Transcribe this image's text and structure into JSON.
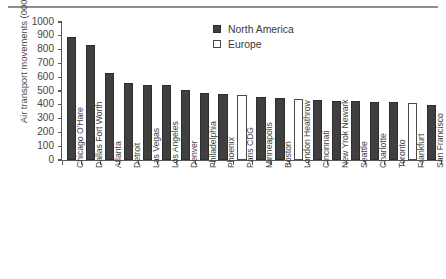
{
  "chart_data": {
    "type": "bar",
    "title": "",
    "subtitle": "",
    "xlabel": "",
    "ylabel": "Air transport movements (000s)",
    "ylim": [
      0,
      1000
    ],
    "ytick_labels": [
      "1000",
      "900",
      "800",
      "700",
      "600",
      "500",
      "400",
      "300",
      "200",
      "100",
      "0"
    ],
    "ytick_values": [
      1000,
      900,
      800,
      700,
      600,
      500,
      400,
      300,
      200,
      100,
      0
    ],
    "grid": false,
    "legend_position": "top-center-right",
    "legend": [
      {
        "label": "North America",
        "swatch": "filled-dark-square",
        "color": "#3f3f3f"
      },
      {
        "label": "Europe",
        "swatch": "open-white-square",
        "color": "#ffffff"
      }
    ],
    "categories": [
      "Chicago O'Hare",
      "Dallas Fort Worth",
      "Atlanta",
      "Detroit",
      "Las Vegas",
      "Los Angeles",
      "Denver",
      "Philadelphia",
      "Phoenix",
      "Paris CDG",
      "Minneapolis",
      "Boston",
      "London Heathrow",
      "Cincinnati",
      "New Yrok Newark",
      "Seattle",
      "Charlotte",
      "Toronto",
      "Frankfurt",
      "San Francisco"
    ],
    "values": [
      895,
      835,
      630,
      557,
      543,
      543,
      505,
      483,
      478,
      468,
      455,
      450,
      443,
      435,
      430,
      428,
      423,
      420,
      410,
      400
    ],
    "series": [
      {
        "name": "North America",
        "values": [
          895,
          835,
          630,
          557,
          543,
          543,
          505,
          483,
          478,
          null,
          455,
          450,
          null,
          435,
          430,
          428,
          423,
          420,
          null,
          400
        ]
      },
      {
        "name": "Europe",
        "values": [
          null,
          null,
          null,
          null,
          null,
          null,
          null,
          null,
          null,
          468,
          null,
          null,
          443,
          null,
          null,
          null,
          null,
          null,
          410,
          null
        ]
      }
    ],
    "group_of_bar": [
      "na",
      "na",
      "na",
      "na",
      "na",
      "na",
      "na",
      "na",
      "na",
      "eu",
      "na",
      "na",
      "eu",
      "na",
      "na",
      "na",
      "na",
      "na",
      "eu",
      "na"
    ]
  }
}
